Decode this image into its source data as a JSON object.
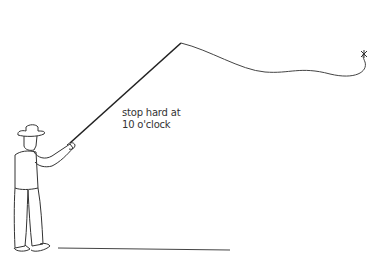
{
  "illustration": {
    "subject": "fly fisherman casting",
    "annotation": {
      "line1": "stop hard at",
      "line2": "10 o'clock"
    },
    "colors": {
      "background": "#ffffff",
      "stroke": "#333333",
      "rod": "#222222"
    }
  }
}
